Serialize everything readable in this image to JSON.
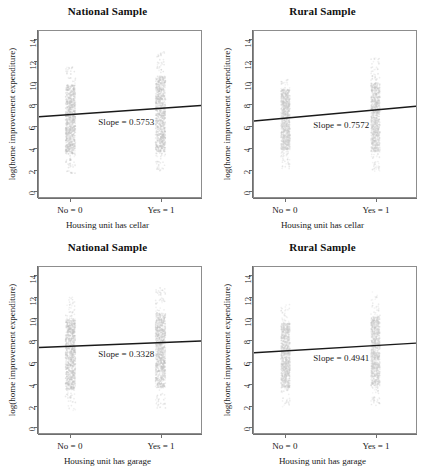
{
  "figure": {
    "partial_top_text": "",
    "axis": {
      "y_title": "log(home improvement expenditure)",
      "y_ticks": [
        0,
        2,
        4,
        6,
        8,
        10,
        12,
        14
      ],
      "y_lim": [
        -0.6,
        14.8
      ],
      "x_ticks": [
        0,
        1
      ],
      "x_tick_labels": [
        "No = 0",
        "Yes = 1"
      ],
      "x_lim": [
        -0.35,
        1.45
      ]
    },
    "panels": [
      {
        "id": "national-cellar",
        "title": "National Sample",
        "x_title": "Housing unit has cellar",
        "slope_label": "Slope = 0.5753",
        "chart_data": {
          "type": "scatter",
          "title": "National Sample",
          "xlabel": "Housing unit has cellar",
          "ylabel": "log(home improvement expenditure)",
          "xlim": [
            -0.35,
            1.45
          ],
          "ylim": [
            -0.6,
            14.8
          ],
          "xtick_values": [
            0,
            1
          ],
          "xtick_labels": [
            "No = 0",
            "Yes = 1"
          ],
          "ytick_values": [
            0,
            2,
            4,
            6,
            8,
            10,
            12,
            14
          ],
          "grid": false,
          "legend": "none",
          "annotation": "Slope = 0.5753",
          "series": [
            {
              "name": "No = 0",
              "x": 0,
              "point_color": "#bdbdbd",
              "y_range": [
                1.6,
                11.5
              ],
              "y_dense_range": [
                3.4,
                9.8
              ],
              "jitter_width": 0.055
            },
            {
              "name": "Yes = 1",
              "x": 1,
              "point_color": "#bdbdbd",
              "y_range": [
                1.7,
                13.0
              ],
              "y_dense_range": [
                3.6,
                10.6
              ],
              "jitter_width": 0.055
            }
          ],
          "fit_line": {
            "slope": 0.5753,
            "intercept": 7.05,
            "color": "#1a1a1a",
            "x_start": -0.35,
            "x_end": 1.45
          }
        }
      },
      {
        "id": "rural-cellar",
        "title": "Rural Sample",
        "x_title": "Housing unit has cellar",
        "slope_label": "Slope = 0.7572",
        "chart_data": {
          "type": "scatter",
          "title": "Rural Sample",
          "xlabel": "Housing unit has cellar",
          "ylabel": "log(home improvement expenditure)",
          "xlim": [
            -0.35,
            1.45
          ],
          "ylim": [
            -0.6,
            14.8
          ],
          "xtick_values": [
            0,
            1
          ],
          "xtick_labels": [
            "No = 0",
            "Yes = 1"
          ],
          "ytick_values": [
            0,
            2,
            4,
            6,
            8,
            10,
            12,
            14
          ],
          "grid": false,
          "legend": "none",
          "annotation": "Slope = 0.7572",
          "series": [
            {
              "name": "No = 0",
              "x": 0,
              "point_color": "#c4c4c4",
              "y_range": [
                2.0,
                10.3
              ],
              "y_dense_range": [
                3.8,
                9.4
              ],
              "jitter_width": 0.05
            },
            {
              "name": "Yes = 1",
              "x": 1,
              "point_color": "#c4c4c4",
              "y_range": [
                1.8,
                12.3
              ],
              "y_dense_range": [
                3.6,
                10.0
              ],
              "jitter_width": 0.05
            }
          ],
          "fit_line": {
            "slope": 0.7572,
            "intercept": 6.72,
            "color": "#1a1a1a",
            "x_start": -0.35,
            "x_end": 1.45
          }
        }
      },
      {
        "id": "national-garage",
        "title": "National Sample",
        "x_title": "Housing unit has garage",
        "slope_label": "Slope = 0.3328",
        "chart_data": {
          "type": "scatter",
          "title": "National Sample",
          "xlabel": "Housing unit has garage",
          "ylabel": "log(home improvement expenditure)",
          "xlim": [
            -0.35,
            1.45
          ],
          "ylim": [
            -0.6,
            14.8
          ],
          "xtick_values": [
            0,
            1
          ],
          "xtick_labels": [
            "No = 0",
            "Yes = 1"
          ],
          "ytick_values": [
            0,
            2,
            4,
            6,
            8,
            10,
            12,
            14
          ],
          "grid": false,
          "legend": "none",
          "annotation": "Slope = 0.3328",
          "series": [
            {
              "name": "No = 0",
              "x": 0,
              "point_color": "#bdbdbd",
              "y_range": [
                1.5,
                12.0
              ],
              "y_dense_range": [
                3.4,
                9.9
              ],
              "jitter_width": 0.055
            },
            {
              "name": "Yes = 1",
              "x": 1,
              "point_color": "#bdbdbd",
              "y_range": [
                1.7,
                12.9
              ],
              "y_dense_range": [
                3.6,
                10.5
              ],
              "jitter_width": 0.055
            }
          ],
          "fit_line": {
            "slope": 0.3328,
            "intercept": 7.45,
            "color": "#1a1a1a",
            "x_start": -0.35,
            "x_end": 1.45
          }
        }
      },
      {
        "id": "rural-garage",
        "title": "Rural Sample",
        "x_title": "Housing unit has garage",
        "slope_label": "Slope = 0.4941",
        "chart_data": {
          "type": "scatter",
          "title": "Rural Sample",
          "xlabel": "Housing unit has garage",
          "ylabel": "log(home improvement expenditure)",
          "xlim": [
            -0.35,
            1.45
          ],
          "ylim": [
            -0.6,
            14.8
          ],
          "xtick_values": [
            0,
            1
          ],
          "xtick_labels": [
            "No = 0",
            "Yes = 1"
          ],
          "ytick_values": [
            0,
            2,
            4,
            6,
            8,
            10,
            12,
            14
          ],
          "grid": false,
          "legend": "none",
          "annotation": "Slope = 0.4941",
          "series": [
            {
              "name": "No = 0",
              "x": 0,
              "point_color": "#c4c4c4",
              "y_range": [
                1.8,
                11.4
              ],
              "y_dense_range": [
                3.6,
                9.6
              ],
              "jitter_width": 0.05
            },
            {
              "name": "Yes = 1",
              "x": 1,
              "point_color": "#c4c4c4",
              "y_range": [
                1.9,
                12.5
              ],
              "y_dense_range": [
                3.8,
                10.2
              ],
              "jitter_width": 0.05
            }
          ],
          "fit_line": {
            "slope": 0.4941,
            "intercept": 7.02,
            "color": "#1a1a1a",
            "x_start": -0.35,
            "x_end": 1.45
          }
        }
      }
    ]
  }
}
